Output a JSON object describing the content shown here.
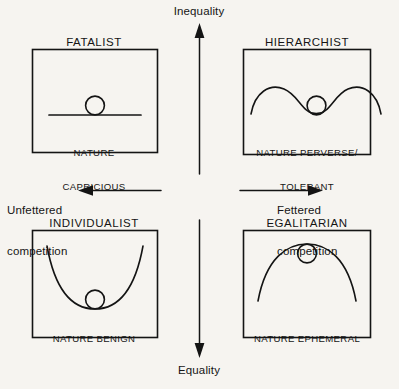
{
  "figure": {
    "kind": "2x2-cultural-theory-grid",
    "background_color": "#f6f4f0",
    "line_color": "#141414"
  },
  "axes": {
    "vertical": {
      "top_label": "Inequality",
      "bottom_label": "Equality",
      "top_arrow_direction": "up",
      "bottom_arrow_direction": "down"
    },
    "horizontal": {
      "left_label": "Unfettered\ncompetition",
      "left_label_line1": "Unfettered",
      "left_label_line2": "competition",
      "right_label": "Fettered\ncompetition",
      "right_label_line1": "Fettered",
      "right_label_line2": "competition",
      "left_arrow_direction": "left",
      "right_arrow_direction": "right"
    }
  },
  "quadrants": [
    {
      "id": "fatalist",
      "position": "top-left",
      "title": "FATALIST",
      "caption": "NATURE\nCAPRICIOUS",
      "caption_line1": "NATURE",
      "caption_line2": "CAPRICIOUS",
      "landscape": "flat-line",
      "ball_resting_on": "flat horizontal surface"
    },
    {
      "id": "hierarchist",
      "position": "top-right",
      "title": "HIERARCHIST",
      "caption": "NATURE PERVERSE/\nTOLERANT",
      "caption_line1": "NATURE PERVERSE/",
      "caption_line2": "TOLERANT",
      "landscape": "two-humps-with-central-valley",
      "ball_resting_on": "central valley between two peaks"
    },
    {
      "id": "individualist",
      "position": "bottom-left",
      "title": "INDIVIDUALIST",
      "caption": "NATURE BENIGN",
      "caption_line1": "NATURE BENIGN",
      "caption_line2": "",
      "landscape": "u-shaped-basin",
      "ball_resting_on": "bottom of a deep basin"
    },
    {
      "id": "egalitarian",
      "position": "bottom-right",
      "title": "EGALITARIAN",
      "caption": "NATURE EPHEMERAL",
      "caption_line1": "NATURE EPHEMERAL",
      "caption_line2": "",
      "landscape": "inverted-u-dome",
      "ball_resting_on": "apex of a dome"
    }
  ]
}
